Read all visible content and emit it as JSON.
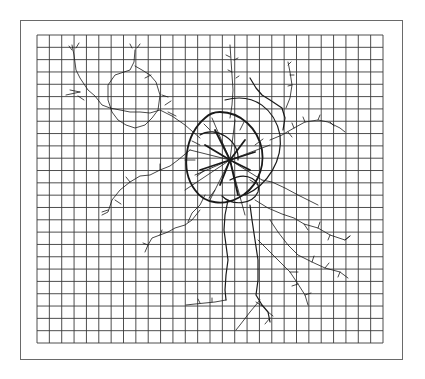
{
  "figure": {
    "grid": {
      "left": 37,
      "top": 35,
      "right": 383,
      "bottom": 343,
      "columns": 28,
      "rows": 25,
      "line_color": "#3a3a3a"
    },
    "frame": {
      "border_color": "#6a6a6a"
    },
    "root_color": "#1a1a1a",
    "center": {
      "x": 230,
      "y": 160
    }
  }
}
